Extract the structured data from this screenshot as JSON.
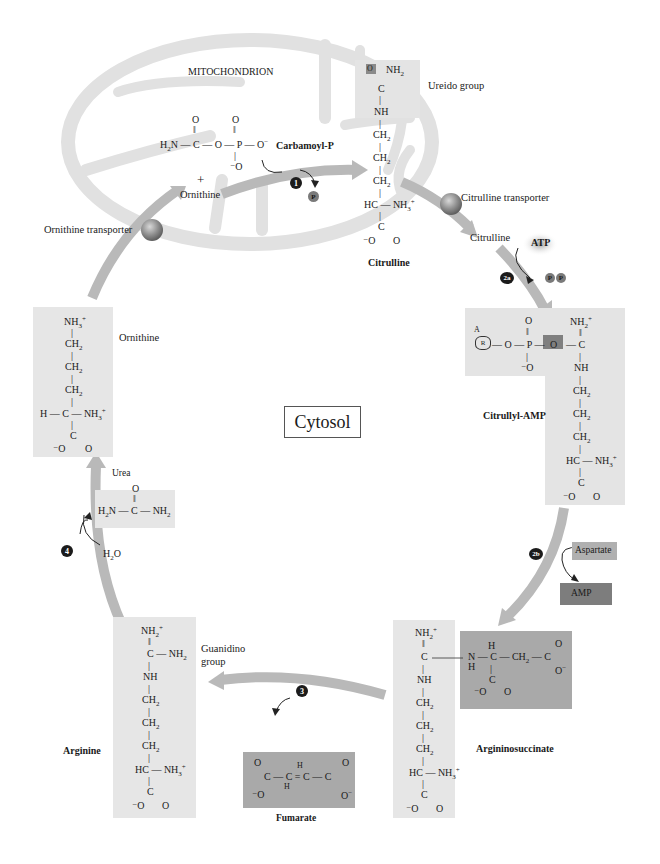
{
  "compartments": {
    "mitochondrion": "MITOCHONDRION",
    "cytosol": "Cytosol"
  },
  "transporters": {
    "ornithine": "Ornithine transporter",
    "citrulline": "Citrulline transporter"
  },
  "steps": [
    {
      "id": "1",
      "marker": "1",
      "inputs": [
        "Carbamoyl-P",
        "Ornithine"
      ],
      "output": "Citrulline",
      "released": "Pi"
    },
    {
      "id": "2a",
      "marker": "2a",
      "input": "Citrulline",
      "cosubstrate": "ATP",
      "released": "PPi",
      "output": "Citrullyl-AMP"
    },
    {
      "id": "2b",
      "marker": "2b",
      "input": "Citrullyl-AMP",
      "cosubstrate": "Aspartate",
      "released": "AMP",
      "output": "Argininosuccinate"
    },
    {
      "id": "3",
      "marker": "3",
      "input": "Argininosuccinate",
      "released": "Fumarate",
      "output": "Arginine"
    },
    {
      "id": "4",
      "marker": "4",
      "input": "Arginine",
      "cosubstrate": "H2O",
      "released": "Urea",
      "output": "Ornithine"
    }
  ],
  "molecules": {
    "carbamoyl_p": {
      "name": "Carbamoyl-P"
    },
    "ornithine_mito": {
      "name": "Ornithine",
      "plus": "+"
    },
    "citrulline": {
      "name": "Citrulline",
      "group_label": "Ureido group"
    },
    "citrulline_cyto": {
      "name": "Citrulline"
    },
    "citrullyl_amp": {
      "name": "Citrullyl-AMP"
    },
    "argininosuccinate": {
      "name": "Argininosuccinate"
    },
    "arginine": {
      "name": "Arginine",
      "group_label": "Guanidino group"
    },
    "fumarate": {
      "name": "Fumarate"
    },
    "ornithine": {
      "name": "Ornithine"
    },
    "urea": {
      "name": "Urea"
    }
  },
  "cofactors": {
    "atp": "ATP",
    "ppi": [
      "P",
      "P"
    ],
    "pi": "P",
    "aspartate": "Aspartate",
    "amp": "AMP",
    "water": "H2O"
  },
  "markers": {
    "m1": "1",
    "m2a": "2a",
    "m2b": "2b",
    "m3": "3",
    "m4": "4"
  },
  "colors": {
    "arrow": "#b7b7b7",
    "mito": "#e3e3e3",
    "panel_light": "#e6e6e6",
    "panel_dark": "#a9a9a9",
    "amp_box": "#7d7d7d",
    "marker": "#1b1b1b",
    "transporter": "#8b8b8b"
  }
}
